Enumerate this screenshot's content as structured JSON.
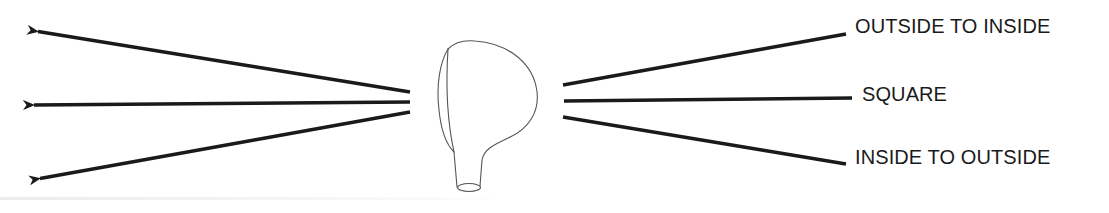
{
  "diagram": {
    "type": "golf-swing-path-diagram",
    "colors": {
      "stroke": "#1a1a1a",
      "outline": "#555555",
      "background": "#ffffff"
    },
    "labels": {
      "top": "OUTSIDE TO INSIDE",
      "middle": "SQUARE",
      "bottom": "INSIDE TO OUTSIDE"
    },
    "left_arrows": [
      {
        "name": "ball-flight-arrow-top",
        "from": [
          410,
          92
        ],
        "to": [
          35,
          31
        ]
      },
      {
        "name": "ball-flight-arrow-middle",
        "from": [
          410,
          102
        ],
        "to": [
          31,
          105
        ]
      },
      {
        "name": "ball-flight-arrow-bottom",
        "from": [
          410,
          112
        ],
        "to": [
          37,
          179
        ]
      }
    ],
    "right_lines": [
      {
        "name": "swing-path-line-outside-to-inside",
        "from": [
          563,
          85
        ],
        "to": [
          846,
          34
        ]
      },
      {
        "name": "swing-path-line-square",
        "from": [
          564,
          101
        ],
        "to": [
          852,
          98
        ]
      },
      {
        "name": "swing-path-line-inside-to-outside",
        "from": [
          563,
          117
        ],
        "to": [
          846,
          164
        ]
      }
    ],
    "club_head": {
      "icon": "golf-club-head-icon",
      "hosel_center": [
        469,
        188
      ]
    }
  }
}
